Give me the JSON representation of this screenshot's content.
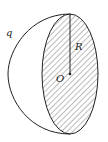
{
  "diagram": {
    "type": "hemisphere",
    "labels": {
      "charge": "q",
      "radius": "R",
      "center": "O"
    },
    "colors": {
      "stroke": "#222222",
      "hatch": "#555555",
      "background": "#ffffff"
    }
  }
}
